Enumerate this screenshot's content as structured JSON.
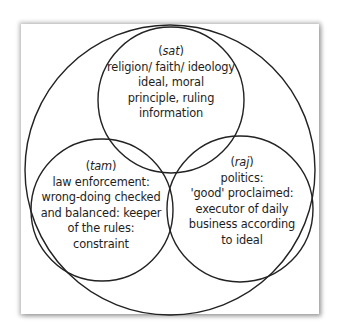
{
  "diagram": {
    "type": "venn",
    "outer_circle": {
      "cx": 170,
      "cy": 170,
      "r": 145
    },
    "stroke_color": "#222222",
    "circles": [
      {
        "id": "sat",
        "term": "sat",
        "geometry": {
          "cx": 171,
          "cy": 100,
          "r": 73
        },
        "lines": [
          "religion/ faith/ ideology",
          "ideal, moral",
          "principle, ruling",
          "information"
        ]
      },
      {
        "id": "tam",
        "term": "tam",
        "geometry": {
          "cx": 102,
          "cy": 210,
          "r": 71
        },
        "lines": [
          "law enforcement:",
          "wrong-doing checked",
          "and balanced: keeper",
          "of the rules:",
          "constraint"
        ]
      },
      {
        "id": "raj",
        "term": "raj",
        "geometry": {
          "cx": 240,
          "cy": 209,
          "r": 73
        },
        "lines": [
          "politics:",
          "'good' proclaimed:",
          "executor of daily",
          "business according",
          "to ideal"
        ]
      }
    ]
  }
}
